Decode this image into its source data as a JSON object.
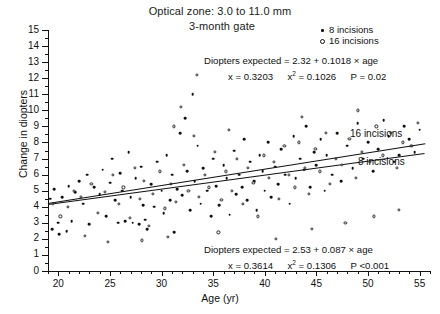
{
  "title": {
    "line1": "Optical zone: 3.0 to 11.0 mm",
    "line2": "3-month gate"
  },
  "legend": {
    "items": [
      {
        "marker": "filled-dot",
        "label": "8 incisions"
      },
      {
        "marker": "open-circle",
        "label": "16 incisions"
      }
    ]
  },
  "annotations": {
    "top": {
      "equation": "Diopters expected = 2.32 + 0.1018 × age",
      "r_label": "x",
      "r_value": "= 0.3203",
      "r2_label": "x",
      "r2_sup": "2",
      "r2_value": "= 0.1026",
      "p_value": "P = 0.02"
    },
    "bottom": {
      "equation": "Diopters expected = 2.53 + 0.087 × age",
      "r_label": "x",
      "r_value": "= 0.3614",
      "r2_label": "x",
      "r2_sup": "2",
      "r2_value": "= 0.1306",
      "p_value": "P <0.001"
    }
  },
  "line_labels": {
    "upper": "16 incisions",
    "lower": "8 incisions"
  },
  "chart_data": {
    "type": "scatter",
    "xlabel": "Age (yr)",
    "ylabel": "Change in diopters",
    "xlim": [
      19,
      56
    ],
    "ylim": [
      0,
      15
    ],
    "xticks": [
      20,
      25,
      30,
      35,
      40,
      45,
      50,
      55
    ],
    "yticks": [
      0,
      1,
      2,
      3,
      4,
      5,
      6,
      7,
      8,
      9,
      10,
      11,
      12,
      13,
      14,
      15
    ],
    "grid": false,
    "legend_position": "top-right",
    "series": [
      {
        "name": "8 incisions",
        "marker": "filled-dot",
        "fit": {
          "label": "8 incisions",
          "intercept": 2.53,
          "slope": 0.087,
          "r": 0.3614,
          "r2": 0.1306,
          "p": "<0.001",
          "x_range": [
            19,
            55.5
          ]
        },
        "points": [
          [
            19.2,
            4.5
          ],
          [
            19.4,
            2.6
          ],
          [
            19.6,
            5.1
          ],
          [
            20.0,
            3.0
          ],
          [
            20.1,
            2.3
          ],
          [
            20.4,
            4.6
          ],
          [
            20.8,
            2.5
          ],
          [
            21.0,
            5.3
          ],
          [
            21.3,
            3.1
          ],
          [
            21.6,
            4.9
          ],
          [
            22.0,
            5.6
          ],
          [
            22.4,
            4.2
          ],
          [
            22.8,
            6.0
          ],
          [
            23.0,
            2.9
          ],
          [
            23.5,
            5.2
          ],
          [
            24.0,
            4.8
          ],
          [
            24.3,
            6.3
          ],
          [
            24.6,
            3.4
          ],
          [
            25.0,
            5.5
          ],
          [
            25.2,
            7.0
          ],
          [
            25.5,
            4.4
          ],
          [
            25.8,
            3.0
          ],
          [
            26.0,
            6.1
          ],
          [
            26.2,
            5.0
          ],
          [
            26.5,
            3.1
          ],
          [
            26.8,
            7.4
          ],
          [
            27.0,
            4.6
          ],
          [
            27.2,
            3.0
          ],
          [
            27.5,
            5.8
          ],
          [
            27.8,
            2.9
          ],
          [
            28.0,
            6.5
          ],
          [
            28.2,
            4.1
          ],
          [
            28.4,
            3.2
          ],
          [
            28.6,
            2.6
          ],
          [
            29.0,
            5.4
          ],
          [
            29.3,
            4.0
          ],
          [
            29.6,
            6.8
          ],
          [
            30.0,
            5.0
          ],
          [
            30.2,
            3.6
          ],
          [
            30.5,
            7.2
          ],
          [
            30.8,
            4.4
          ],
          [
            31.0,
            6.0
          ],
          [
            31.2,
            2.4
          ],
          [
            31.5,
            5.1
          ],
          [
            31.8,
            8.6
          ],
          [
            32.0,
            4.7
          ],
          [
            32.3,
            9.5
          ],
          [
            32.5,
            6.2
          ],
          [
            32.8,
            3.8
          ],
          [
            33.0,
            11.0
          ],
          [
            33.2,
            5.6
          ],
          [
            33.5,
            7.8
          ],
          [
            33.8,
            4.2
          ],
          [
            34.0,
            6.4
          ],
          [
            34.4,
            5.0
          ],
          [
            34.8,
            3.4
          ],
          [
            35.0,
            7.0
          ],
          [
            35.3,
            5.3
          ],
          [
            35.6,
            4.1
          ],
          [
            36.0,
            6.6
          ],
          [
            36.3,
            5.8
          ],
          [
            36.6,
            3.5
          ],
          [
            37.0,
            7.5
          ],
          [
            37.2,
            4.8
          ],
          [
            37.5,
            6.0
          ],
          [
            37.8,
            5.2
          ],
          [
            38.0,
            8.2
          ],
          [
            38.3,
            4.4
          ],
          [
            38.6,
            6.8
          ],
          [
            39.0,
            5.6
          ],
          [
            39.2,
            3.8
          ],
          [
            39.5,
            7.2
          ],
          [
            39.8,
            6.2
          ],
          [
            40.0,
            5.0
          ],
          [
            40.3,
            8.0
          ],
          [
            40.6,
            4.6
          ],
          [
            41.0,
            6.5
          ],
          [
            41.3,
            5.4
          ],
          [
            41.6,
            7.6
          ],
          [
            42.0,
            6.0
          ],
          [
            42.4,
            4.2
          ],
          [
            42.8,
            8.4
          ],
          [
            43.0,
            5.8
          ],
          [
            43.4,
            7.0
          ],
          [
            43.8,
            6.3
          ],
          [
            44.0,
            9.0
          ],
          [
            44.4,
            5.2
          ],
          [
            44.8,
            7.4
          ],
          [
            45.0,
            6.6
          ],
          [
            45.4,
            8.2
          ],
          [
            45.8,
            5.0
          ],
          [
            46.0,
            7.2
          ],
          [
            46.5,
            6.0
          ],
          [
            47.0,
            8.6
          ],
          [
            47.4,
            5.6
          ],
          [
            48.0,
            7.8
          ],
          [
            48.5,
            6.4
          ],
          [
            49.0,
            9.2
          ],
          [
            49.5,
            7.0
          ],
          [
            50.0,
            8.0
          ],
          [
            50.5,
            6.2
          ],
          [
            51.0,
            7.6
          ],
          [
            51.5,
            9.4
          ],
          [
            52.0,
            8.4
          ],
          [
            52.5,
            6.8
          ],
          [
            53.0,
            7.2
          ],
          [
            53.5,
            9.0
          ],
          [
            54.0,
            8.2
          ],
          [
            54.5,
            7.4
          ],
          [
            55.0,
            8.8
          ]
        ]
      },
      {
        "name": "16 incisions",
        "marker": "open-circle",
        "fit": {
          "label": "16 incisions",
          "intercept": 2.32,
          "slope": 0.1018,
          "r": 0.3203,
          "r2": 0.1026,
          "p": "0.02",
          "x_range": [
            19,
            55.5
          ]
        },
        "points": [
          [
            19.5,
            4.2
          ],
          [
            20.2,
            3.4
          ],
          [
            20.9,
            4.0
          ],
          [
            21.5,
            5.0
          ],
          [
            22.2,
            4.6
          ],
          [
            23.2,
            5.4
          ],
          [
            23.8,
            3.6
          ],
          [
            24.5,
            4.9
          ],
          [
            25.3,
            6.0
          ],
          [
            25.9,
            4.2
          ],
          [
            26.3,
            5.2
          ],
          [
            26.9,
            3.3
          ],
          [
            27.4,
            6.4
          ],
          [
            27.9,
            4.5
          ],
          [
            28.3,
            5.6
          ],
          [
            28.8,
            2.8
          ],
          [
            29.2,
            4.8
          ],
          [
            29.8,
            6.2
          ],
          [
            30.3,
            3.9
          ],
          [
            30.9,
            5.4
          ],
          [
            31.4,
            4.3
          ],
          [
            31.9,
            10.2
          ],
          [
            32.2,
            6.6
          ],
          [
            32.6,
            5.0
          ],
          [
            33.1,
            8.4
          ],
          [
            33.6,
            4.6
          ],
          [
            34.2,
            6.0
          ],
          [
            34.6,
            5.2
          ],
          [
            35.2,
            7.4
          ],
          [
            35.8,
            4.4
          ],
          [
            36.2,
            6.2
          ],
          [
            36.8,
            5.0
          ],
          [
            37.3,
            7.0
          ],
          [
            37.9,
            4.2
          ],
          [
            38.4,
            6.4
          ],
          [
            38.9,
            5.5
          ],
          [
            39.3,
            3.4
          ],
          [
            39.9,
            7.2
          ],
          [
            40.4,
            5.8
          ],
          [
            40.9,
            6.8
          ],
          [
            41.4,
            4.5
          ],
          [
            41.9,
            7.8
          ],
          [
            42.3,
            6.0
          ],
          [
            42.9,
            5.2
          ],
          [
            43.3,
            8.0
          ],
          [
            43.9,
            6.4
          ],
          [
            44.3,
            4.8
          ],
          [
            44.9,
            7.6
          ],
          [
            45.3,
            6.2
          ],
          [
            45.9,
            8.6
          ],
          [
            46.3,
            5.4
          ],
          [
            46.9,
            7.0
          ],
          [
            47.5,
            6.6
          ],
          [
            48.2,
            8.2
          ],
          [
            48.8,
            5.8
          ],
          [
            49.4,
            7.4
          ],
          [
            50.2,
            6.8
          ],
          [
            50.8,
            9.0
          ],
          [
            51.4,
            7.2
          ],
          [
            52.2,
            8.6
          ],
          [
            52.8,
            6.4
          ],
          [
            53.4,
            8.0
          ],
          [
            54.2,
            7.8
          ],
          [
            54.8,
            9.2
          ],
          [
            22.6,
            2.2
          ],
          [
            24.8,
            1.8
          ],
          [
            28.1,
            1.9
          ],
          [
            30.6,
            2.1
          ],
          [
            35.5,
            2.4
          ],
          [
            41.1,
            2.0
          ],
          [
            44.6,
            2.6
          ],
          [
            47.8,
            3.0
          ],
          [
            50.6,
            3.4
          ],
          [
            53.0,
            3.8
          ],
          [
            33.4,
            12.2
          ],
          [
            31.2,
            9.0
          ],
          [
            36.5,
            8.8
          ],
          [
            43.6,
            9.6
          ],
          [
            49.0,
            10.0
          ]
        ]
      }
    ]
  }
}
